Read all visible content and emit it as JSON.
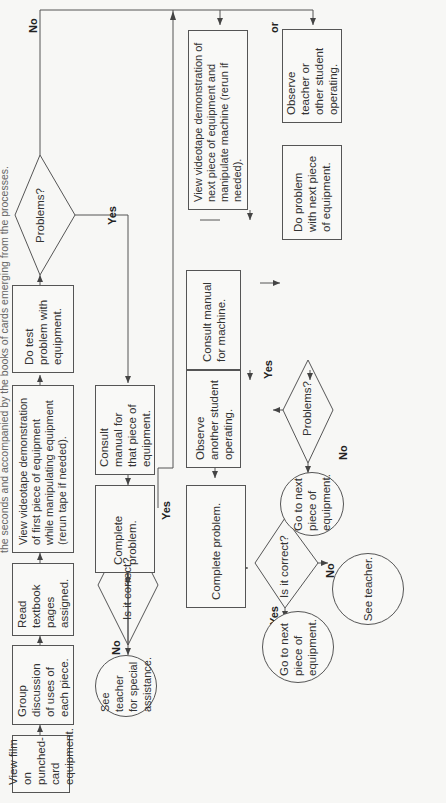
{
  "caption": "the seconds and accompanied by the books of cards emerging from the processes.",
  "nodes": {
    "view_film": "View film on punched-card equipment.",
    "group_discussion": "Group discussion of uses of each piece.",
    "read_textbook": "Read textbook pages assigned.",
    "view_videotape_first": "View videotape demonstration of first piece of equipment while manipulating equipment (rerun tape if needed).",
    "do_test_problem": "Do test problem with equipment.",
    "problems_1": "Problems?",
    "consult_manual_piece": "Consult manual for that piece of equipment.",
    "complete_problem_1": "Complete problem.",
    "is_correct_1": "Is it correct?",
    "see_teacher_special": "See teacher for special assistance.",
    "view_videotape_next": "View videotape demonstration of next piece of equipment and manipulate machine (rerun if needed).",
    "observe_teacher": "Observe teacher or other student operating.",
    "do_problem_next": "Do problem with next piece of equipment.",
    "problems_2": "Problems?",
    "consult_manual_machine": "Consult manual for machine.",
    "observe_another": "Observe another student operating.",
    "complete_problem_2": "Complete problem.",
    "is_correct_2": "Is it correct?",
    "go_next_1": "Go to next piece of equipment.",
    "go_next_2": "Go to next piece of equipment.",
    "see_teacher": "See teacher."
  },
  "labels": {
    "no_top": "No",
    "yes_problems1": "Yes",
    "yes_correct1": "Yes",
    "no_correct1": "No",
    "or": "or",
    "yes_problems2": "Yes",
    "no_problems2": "No",
    "yes_correct2": "Yes",
    "no_correct2": "No"
  },
  "colors": {
    "line": "#555555",
    "background": "#f7f7f5",
    "text": "#333333"
  }
}
